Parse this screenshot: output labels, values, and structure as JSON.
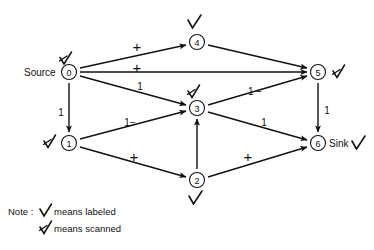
{
  "diagram": {
    "nodes": [
      {
        "id": "0",
        "label": "0",
        "side_text": "Source",
        "side_position": "left",
        "mark": "scanned",
        "mark_position": "above-left",
        "x": 69,
        "y": 72
      },
      {
        "id": "1",
        "label": "1",
        "side_text": "",
        "side_position": "left",
        "mark": "scanned",
        "mark_position": "left",
        "x": 69,
        "y": 143
      },
      {
        "id": "2",
        "label": "2",
        "side_text": "",
        "side_position": "below",
        "mark": "labeled",
        "mark_position": "below",
        "x": 197,
        "y": 180
      },
      {
        "id": "3",
        "label": "3",
        "side_text": "",
        "side_position": "above",
        "mark": "scanned",
        "mark_position": "above",
        "x": 197,
        "y": 108
      },
      {
        "id": "4",
        "label": "4",
        "side_text": "",
        "side_position": "above",
        "mark": "labeled",
        "mark_position": "above",
        "x": 197,
        "y": 42
      },
      {
        "id": "5",
        "label": "5",
        "side_text": "",
        "side_position": "right",
        "mark": "scanned",
        "mark_position": "right",
        "x": 318,
        "y": 72
      },
      {
        "id": "6",
        "label": "6",
        "side_text": "Sink",
        "side_position": "right",
        "mark": "labeled",
        "mark_position": "far-right",
        "x": 318,
        "y": 143
      }
    ],
    "edges": [
      {
        "from": "0",
        "to": "4",
        "label": "+",
        "label_kind": "plus",
        "lx": 137,
        "ly": 47
      },
      {
        "from": "0",
        "to": "5",
        "label": "+",
        "label_kind": "plus",
        "lx": 137,
        "ly": 68
      },
      {
        "from": "0",
        "to": "3",
        "label": "1",
        "label_kind": "number",
        "lx": 140,
        "ly": 86
      },
      {
        "from": "0",
        "to": "1",
        "label": "1",
        "label_kind": "number",
        "lx": 61,
        "ly": 112
      },
      {
        "from": "1",
        "to": "3",
        "label": "1−",
        "label_kind": "number",
        "lx": 128,
        "ly": 122
      },
      {
        "from": "1",
        "to": "2",
        "label": "+",
        "label_kind": "plus",
        "lx": 134,
        "ly": 157
      },
      {
        "from": "2",
        "to": "3",
        "label": "",
        "label_kind": "none",
        "lx": 0,
        "ly": 0
      },
      {
        "from": "2",
        "to": "6",
        "label": "+",
        "label_kind": "plus",
        "lx": 248,
        "ly": 157
      },
      {
        "from": "3",
        "to": "5",
        "label": "1 −",
        "label_kind": "number",
        "lx": 253,
        "ly": 91
      },
      {
        "from": "3",
        "to": "6",
        "label": "1",
        "label_kind": "number",
        "lx": 264,
        "ly": 122
      },
      {
        "from": "4",
        "to": "5",
        "label": "",
        "label_kind": "none",
        "lx": 0,
        "ly": 0
      },
      {
        "from": "5",
        "to": "6",
        "label": "1",
        "label_kind": "number",
        "lx": 326,
        "ly": 110
      }
    ],
    "note": {
      "prefix": "Note :",
      "line1_text": "means  labeled",
      "line1_mark": "labeled",
      "line2_text": "means  scanned",
      "line2_mark": "scanned"
    },
    "colors": {
      "ink": "#111111",
      "background": "#ffffff"
    }
  }
}
